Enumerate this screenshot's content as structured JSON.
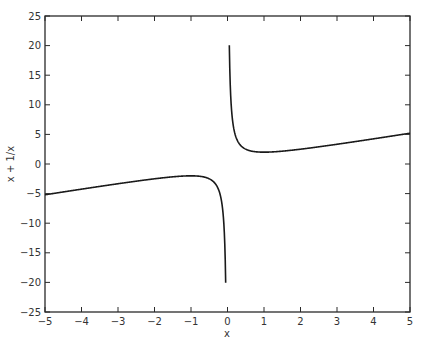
{
  "chart_data": {
    "type": "line",
    "title": "",
    "xlabel": "x",
    "ylabel": "x + 1/x",
    "xlim": [
      -5,
      5
    ],
    "ylim": [
      -25,
      25
    ],
    "grid": false,
    "xticks": [
      -5,
      -4,
      -3,
      -2,
      -1,
      0,
      1,
      2,
      3,
      4,
      5
    ],
    "yticks": [
      -25,
      -20,
      -15,
      -10,
      -5,
      0,
      5,
      10,
      15,
      20,
      25
    ],
    "xtick_labels": [
      "−5",
      "−4",
      "−3",
      "−2",
      "−1",
      "0",
      "1",
      "2",
      "3",
      "4",
      "5"
    ],
    "ytick_labels": [
      "−25",
      "−20",
      "−15",
      "−10",
      "−5",
      "0",
      "5",
      "10",
      "15",
      "20",
      "25"
    ],
    "series": [
      {
        "name": "x + 1/x (x<0)",
        "function": "x + 1/x",
        "domain": [
          -5,
          -0.05
        ],
        "color": "#1a1a1a",
        "points": [
          [
            -5,
            -5.2
          ],
          [
            -4,
            -4.25
          ],
          [
            -3,
            -3.33
          ],
          [
            -2,
            -2.5
          ],
          [
            -1.5,
            -2.17
          ],
          [
            -1,
            -2
          ],
          [
            -0.5,
            -2.5
          ],
          [
            -0.3,
            -3.63
          ],
          [
            -0.2,
            -5.2
          ],
          [
            -0.1,
            -10.1
          ],
          [
            -0.05,
            -20.05
          ]
        ]
      },
      {
        "name": "x + 1/x (x>0)",
        "function": "x + 1/x",
        "domain": [
          0.05,
          5
        ],
        "color": "#1a1a1a",
        "points": [
          [
            0.05,
            20.05
          ],
          [
            0.1,
            10.1
          ],
          [
            0.2,
            5.2
          ],
          [
            0.3,
            3.63
          ],
          [
            0.5,
            2.5
          ],
          [
            1,
            2
          ],
          [
            1.5,
            2.17
          ],
          [
            2,
            2.5
          ],
          [
            3,
            3.33
          ],
          [
            4,
            4.25
          ],
          [
            5,
            5.2
          ]
        ]
      }
    ],
    "legend": null
  }
}
